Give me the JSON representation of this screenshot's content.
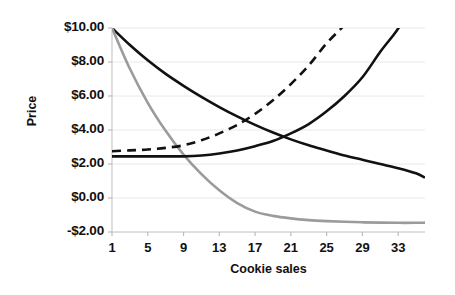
{
  "chart_data": {
    "type": "line",
    "title": "",
    "xlabel": "Cookie sales",
    "ylabel": "Price",
    "xlim": [
      1,
      36
    ],
    "ylim": [
      -2.0,
      10.0
    ],
    "grid": true,
    "legend": "none",
    "background": "#ffffff",
    "x_tick_labels": [
      "1",
      "5",
      "9",
      "13",
      "17",
      "21",
      "25",
      "29",
      "33"
    ],
    "x_tick_values": [
      1,
      5,
      9,
      13,
      17,
      21,
      25,
      29,
      33
    ],
    "y_tick_labels": [
      "$10.00",
      "$8.00",
      "$6.00",
      "$4.00",
      "$2.00",
      "$0.00",
      "-$2.00"
    ],
    "y_tick_values": [
      10,
      8,
      6,
      4,
      2,
      0,
      -2
    ],
    "series": [
      {
        "name": "black-decay-curve",
        "color": "#111111",
        "style": "solid",
        "width": 2.6,
        "x": [
          1,
          3,
          5,
          7,
          9,
          11,
          13,
          15,
          17,
          19,
          21,
          23,
          25,
          27,
          29,
          31,
          33,
          35,
          36
        ],
        "values": [
          10.0,
          9.0,
          8.1,
          7.3,
          6.6,
          5.95,
          5.35,
          4.8,
          4.3,
          3.85,
          3.45,
          3.1,
          2.8,
          2.5,
          2.25,
          2.0,
          1.75,
          1.45,
          1.2
        ]
      },
      {
        "name": "gray-decay-curve",
        "color": "#9b9b9b",
        "style": "solid",
        "width": 2.6,
        "x": [
          1,
          3,
          5,
          7,
          9,
          11,
          13,
          15,
          17,
          19,
          21,
          23,
          25,
          27,
          29,
          31,
          33,
          35,
          36
        ],
        "values": [
          10.0,
          7.6,
          5.6,
          3.95,
          2.55,
          1.4,
          0.45,
          -0.3,
          -0.8,
          -1.05,
          -1.2,
          -1.3,
          -1.36,
          -1.4,
          -1.43,
          -1.45,
          -1.46,
          -1.46,
          -1.45
        ]
      },
      {
        "name": "black-rising-curve",
        "color": "#111111",
        "style": "solid",
        "width": 2.6,
        "x": [
          1,
          3,
          5,
          7,
          9,
          11,
          13,
          15,
          17,
          19,
          21,
          23,
          25,
          27,
          29,
          31,
          32.5,
          33.3
        ],
        "values": [
          2.45,
          2.45,
          2.45,
          2.45,
          2.45,
          2.5,
          2.62,
          2.8,
          3.05,
          3.35,
          3.8,
          4.35,
          5.1,
          6.0,
          7.1,
          8.6,
          9.6,
          10.2
        ]
      },
      {
        "name": "dashed-rising-curve",
        "color": "#111111",
        "style": "dashed",
        "width": 2.6,
        "dash": "9,6",
        "x": [
          1,
          3,
          5,
          7,
          9,
          11,
          13,
          15,
          17,
          19,
          21,
          23,
          25,
          26.5,
          27.2
        ],
        "values": [
          2.75,
          2.8,
          2.85,
          2.95,
          3.1,
          3.4,
          3.8,
          4.3,
          4.95,
          5.75,
          6.7,
          7.8,
          9.1,
          9.9,
          10.3
        ]
      }
    ]
  },
  "axis": {
    "x_title": "Cookie sales",
    "y_title": "Price"
  }
}
